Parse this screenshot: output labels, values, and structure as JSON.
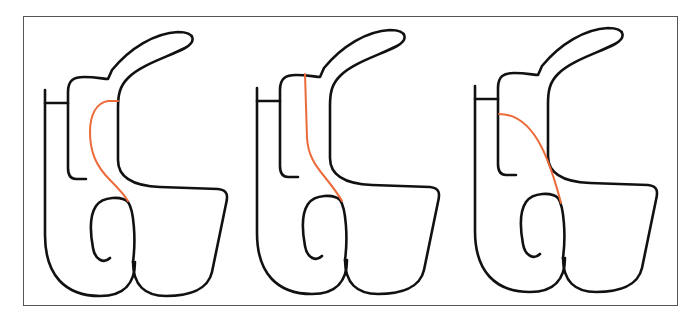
{
  "figure": {
    "outline_color": "#111111",
    "highlight_color": "#EC6B3A",
    "frame_color": "#555555"
  },
  "panels": [
    {
      "index": 1,
      "highlight_variant": "curved path from upper right to lower junction"
    },
    {
      "index": 2,
      "highlight_variant": "near-vertical path from top notch to lower junction"
    },
    {
      "index": 3,
      "highlight_variant": "arc from inner left column to lower junction"
    }
  ]
}
